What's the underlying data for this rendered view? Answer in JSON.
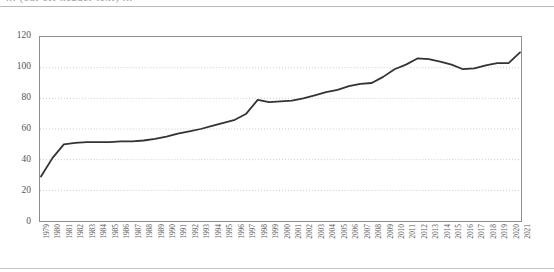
{
  "header": {
    "clipped_text": "... (cut off header text) ...",
    "rule_color": "#b9b9b9"
  },
  "figure": {
    "background": "#ffffff",
    "frame_color": "#8d8d8d",
    "gridline_color": "#c9c9c9",
    "line_color": "#333333"
  },
  "chart_data": {
    "type": "line",
    "title": "",
    "subtitle": "",
    "xlabel": "",
    "ylabel": "",
    "ylim": [
      0,
      120
    ],
    "yticks": [
      0,
      20,
      40,
      60,
      80,
      100,
      120
    ],
    "ytick_labels": [
      "0",
      "20",
      "40",
      "60",
      "80",
      "100",
      "120"
    ],
    "grid": true,
    "grid_axis": "y",
    "grid_style": "dotted",
    "legend": false,
    "legend_position": "none",
    "line_color": "#333333",
    "line_width": 1.8,
    "markers": false,
    "categories": [
      "1979",
      "1980",
      "1981",
      "1982",
      "1983",
      "1984",
      "1985",
      "1986",
      "1987",
      "1988",
      "1989",
      "1990",
      "1991",
      "1992",
      "1993",
      "1994",
      "1995",
      "1996",
      "1997",
      "1998",
      "1999",
      "2000",
      "2001",
      "2002",
      "2003",
      "2004",
      "2005",
      "2006",
      "2007",
      "2008",
      "2009",
      "2010",
      "2011",
      "2012",
      "2013",
      "2014",
      "2015",
      "2016",
      "2017",
      "2018",
      "2019",
      "2020",
      "2021"
    ],
    "values": [
      29,
      41,
      50,
      51,
      51.5,
      51.5,
      51.5,
      52,
      52,
      52.5,
      53.5,
      55,
      57,
      58.5,
      60,
      62,
      64,
      66,
      70,
      79,
      77.5,
      78,
      78.5,
      80,
      82,
      84,
      85.5,
      88,
      89.5,
      90,
      94,
      99,
      102,
      106,
      105.5,
      104,
      102,
      99,
      99.5,
      101.5,
      103,
      103,
      110
    ]
  }
}
